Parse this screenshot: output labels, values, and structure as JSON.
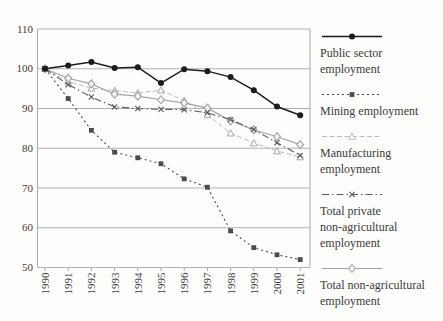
{
  "chart_data": {
    "type": "line",
    "title": "",
    "xlabel": "",
    "ylabel": "",
    "x": [
      1990,
      1991,
      1992,
      1993,
      1994,
      1995,
      1996,
      1997,
      1998,
      1999,
      2000,
      2001
    ],
    "ylim": [
      50,
      110
    ],
    "yticks": [
      110,
      100,
      90,
      80,
      70,
      60,
      50
    ],
    "grid": "horizontal",
    "legend_position": "right",
    "axis_color": "#a9a9a9",
    "text_color": "#3b3b3b",
    "series": [
      {
        "name": "Public sector employment",
        "legend_lines": [
          "Public sector",
          "employment"
        ],
        "marker": "circle",
        "line": "solid",
        "width": 1.5,
        "color": "#1c1c1c",
        "values": [
          100,
          100.8,
          101.7,
          100.2,
          100.4,
          96.4,
          99.9,
          99.4,
          97.9,
          94.6,
          90.5,
          88.3
        ]
      },
      {
        "name": "Mining employment",
        "legend_lines": [
          "Mining employment"
        ],
        "marker": "square",
        "line": "dotted",
        "width": 1.1,
        "color": "#4c4c4c",
        "values": [
          100,
          92.5,
          84.5,
          79.0,
          77.6,
          76.1,
          72.3,
          70.2,
          59.2,
          55.0,
          53.2,
          52.0
        ]
      },
      {
        "name": "Manufacturing employment",
        "legend_lines": [
          "Manufacturing",
          "employment"
        ],
        "marker": "triangle-open",
        "line": "dashed",
        "width": 1.0,
        "color": "#bdbdbd",
        "values": [
          100,
          96.8,
          95.1,
          94.5,
          93.9,
          94.6,
          92.0,
          88.4,
          83.8,
          81.3,
          79.3,
          77.8
        ]
      },
      {
        "name": "Total private non-agricultural employment",
        "legend_lines": [
          "Total private",
          "non-agricultural",
          "employment"
        ],
        "marker": "x",
        "line": "dashdot",
        "width": 1.1,
        "color": "#5a5a5a",
        "values": [
          100,
          96.0,
          92.9,
          90.4,
          90.0,
          89.8,
          89.7,
          88.9,
          87.2,
          84.7,
          81.4,
          78.2
        ]
      },
      {
        "name": "Total non-agricultural employment",
        "legend_lines": [
          "Total non-agricultural",
          "employment"
        ],
        "marker": "diamond-open",
        "line": "solid",
        "width": 1.2,
        "color": "#a3a3a3",
        "values": [
          100,
          97.6,
          96.2,
          93.6,
          93.1,
          92.2,
          91.4,
          90.1,
          86.9,
          84.6,
          82.9,
          80.9
        ]
      }
    ]
  }
}
